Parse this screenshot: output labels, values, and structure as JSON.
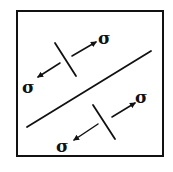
{
  "diagram": {
    "type": "stress-state-schematic",
    "frame": {
      "x": 17,
      "y": 11,
      "width": 146,
      "height": 145,
      "color": "#111111"
    },
    "main_line": {
      "x1": 27,
      "y1": 127,
      "x2": 151,
      "y2": 51
    },
    "upper_element": {
      "tick": {
        "x1": 55,
        "y1": 43,
        "x2": 76,
        "y2": 76
      },
      "arrow_right": {
        "x1": 72,
        "y1": 56,
        "x2": 96,
        "y2": 42
      },
      "arrow_left": {
        "x1": 60,
        "y1": 63,
        "x2": 38,
        "y2": 77
      },
      "label_right": "σ",
      "label_left": "σ"
    },
    "lower_element": {
      "tick": {
        "x1": 93,
        "y1": 105,
        "x2": 115,
        "y2": 139
      },
      "arrow_right": {
        "x1": 112,
        "y1": 117,
        "x2": 135,
        "y2": 103
      },
      "arrow_left": {
        "x1": 98,
        "y1": 124,
        "x2": 74,
        "y2": 140
      },
      "label_right": "σ",
      "label_left": "σ"
    }
  }
}
